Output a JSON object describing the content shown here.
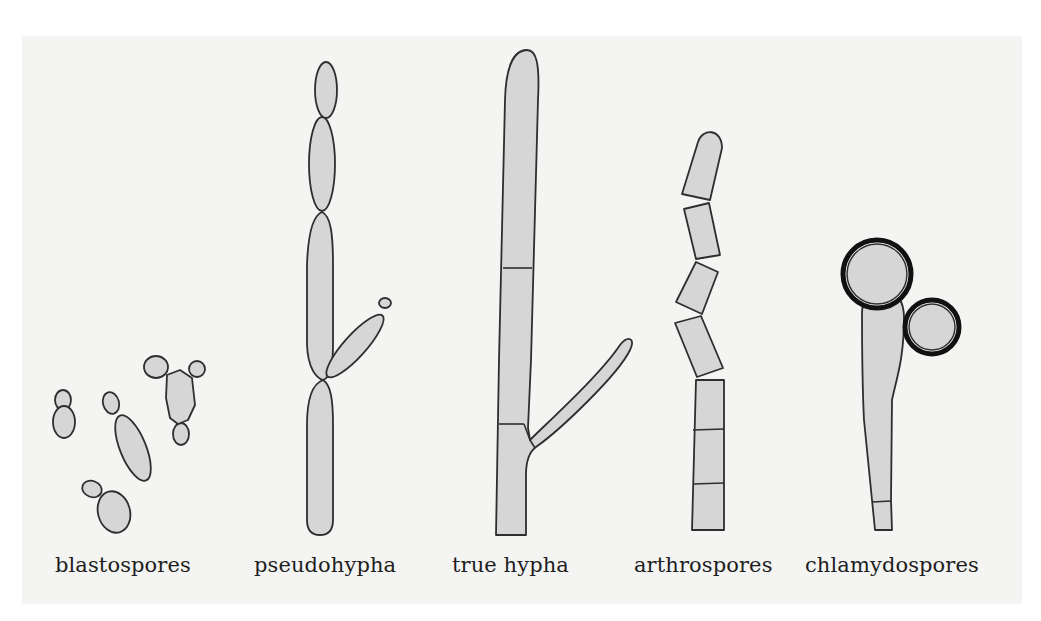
{
  "figure": {
    "type": "diagram",
    "colors": {
      "background": "#f4f4f3",
      "cell_fill": "#d6d6d6",
      "outline": "#2e2e2e",
      "thick_wall": "#111111"
    },
    "panels": [
      {
        "id": "blastospores",
        "label": "blastospores",
        "description": "budding yeast cells in small groups"
      },
      {
        "id": "pseudohypha",
        "label": "pseudohypha",
        "description": "chain of elongated cells with constrictions and a side branch"
      },
      {
        "id": "true-hypha",
        "label": "true hypha",
        "description": "parallel-walled tube with septa and a branch"
      },
      {
        "id": "arthrospores",
        "label": "arthrospores",
        "description": "hypha fragmenting into rectangular spores"
      },
      {
        "id": "chlamydospores",
        "label": "chlamydospores",
        "description": "thick-walled round spores on a hyphal stalk"
      }
    ]
  }
}
